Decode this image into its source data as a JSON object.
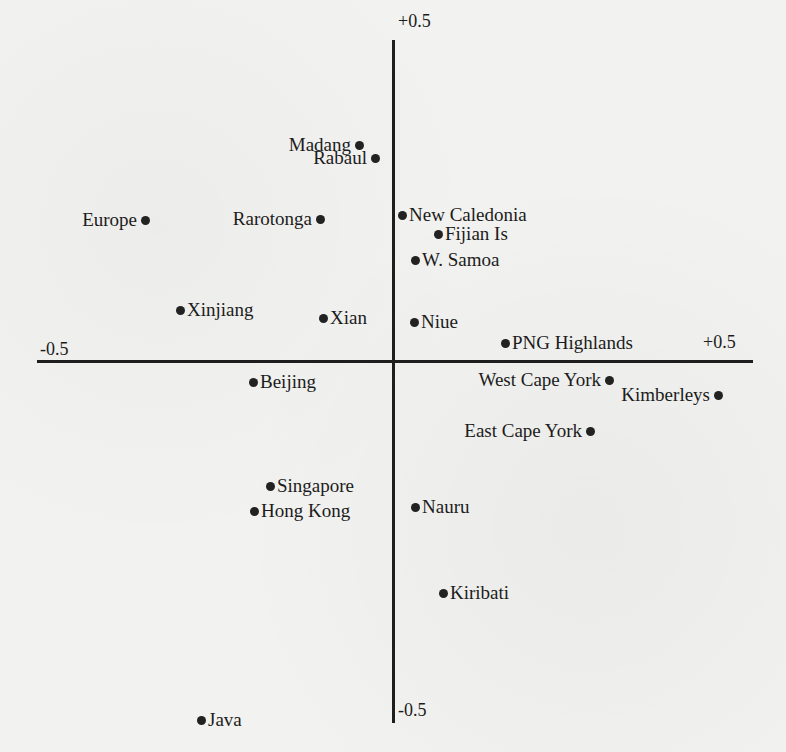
{
  "chart_data": {
    "type": "scatter",
    "title": "",
    "xlabel": "",
    "ylabel": "",
    "xlim": [
      -0.5,
      0.5
    ],
    "ylim": [
      -0.5,
      0.5
    ],
    "grid": false,
    "legend": null,
    "axis_labels": {
      "x_min": "-0.5",
      "x_max": "+0.5",
      "y_max": "+0.5",
      "y_min": "-0.5"
    },
    "points": [
      {
        "label": "Madang",
        "x": -0.05,
        "y": 0.33,
        "label_side": "left"
      },
      {
        "label": "Rabaul",
        "x": -0.03,
        "y": 0.31,
        "label_side": "left"
      },
      {
        "label": "Europe",
        "x": -0.35,
        "y": 0.21,
        "label_side": "left"
      },
      {
        "label": "Rarotonga",
        "x": -0.1,
        "y": 0.21,
        "label_side": "left"
      },
      {
        "label": "New Caledonia",
        "x": 0.01,
        "y": 0.22,
        "label_side": "right"
      },
      {
        "label": "Fijian Is",
        "x": 0.06,
        "y": 0.19,
        "label_side": "right"
      },
      {
        "label": "W. Samoa",
        "x": 0.03,
        "y": 0.15,
        "label_side": "right"
      },
      {
        "label": "Xinjiang",
        "x": -0.3,
        "y": 0.08,
        "label_side": "right"
      },
      {
        "label": "Xian",
        "x": -0.1,
        "y": 0.07,
        "label_side": "right"
      },
      {
        "label": "Niue",
        "x": 0.03,
        "y": 0.06,
        "label_side": "right"
      },
      {
        "label": "PNG Highlands",
        "x": 0.16,
        "y": 0.03,
        "label_side": "right"
      },
      {
        "label": "Beijing",
        "x": -0.2,
        "y": -0.03,
        "label_side": "right"
      },
      {
        "label": "West Cape York",
        "x": 0.3,
        "y": -0.03,
        "label_side": "left"
      },
      {
        "label": "Kimberleys",
        "x": 0.45,
        "y": -0.05,
        "label_side": "left"
      },
      {
        "label": "East Cape York",
        "x": 0.27,
        "y": -0.11,
        "label_side": "left"
      },
      {
        "label": "Singapore",
        "x": -0.17,
        "y": -0.19,
        "label_side": "right"
      },
      {
        "label": "Hong Kong",
        "x": -0.19,
        "y": -0.23,
        "label_side": "right"
      },
      {
        "label": "Nauru",
        "x": 0.03,
        "y": -0.22,
        "label_side": "right"
      },
      {
        "label": "Kiribati",
        "x": 0.07,
        "y": -0.35,
        "label_side": "right"
      },
      {
        "label": "Java",
        "x": -0.27,
        "y": -0.54,
        "label_side": "right"
      }
    ]
  },
  "plot": {
    "axis_labels": {
      "y_max": "+0.5",
      "y_min": "-0.5",
      "x_min": "-0.5",
      "x_max": "+0.5"
    },
    "points": [
      {
        "label": "Madang",
        "px": 359,
        "py": 145,
        "side": "left"
      },
      {
        "label": "Rabaul",
        "px": 375,
        "py": 158,
        "side": "left"
      },
      {
        "label": "Europe",
        "px": 145,
        "py": 220,
        "side": "left"
      },
      {
        "label": "Rarotonga",
        "px": 320,
        "py": 219,
        "side": "left"
      },
      {
        "label": "New Caledonia",
        "px": 402,
        "py": 215,
        "side": "right"
      },
      {
        "label": "Fijian Is",
        "px": 438,
        "py": 234,
        "side": "right"
      },
      {
        "label": "W. Samoa",
        "px": 415,
        "py": 260,
        "side": "right"
      },
      {
        "label": "Xinjiang",
        "px": 180,
        "py": 310,
        "side": "right"
      },
      {
        "label": "Xian",
        "px": 323,
        "py": 318,
        "side": "right"
      },
      {
        "label": "Niue",
        "px": 414,
        "py": 322,
        "side": "right"
      },
      {
        "label": "PNG Highlands",
        "px": 505,
        "py": 343,
        "side": "right"
      },
      {
        "label": "Beijing",
        "px": 253,
        "py": 382,
        "side": "right"
      },
      {
        "label": "West Cape York",
        "px": 609,
        "py": 380,
        "side": "left"
      },
      {
        "label": "Kimberleys",
        "px": 718,
        "py": 395,
        "side": "left"
      },
      {
        "label": "East Cape York",
        "px": 590,
        "py": 431,
        "side": "left"
      },
      {
        "label": "Singapore",
        "px": 270,
        "py": 486,
        "side": "right"
      },
      {
        "label": "Hong Kong",
        "px": 254,
        "py": 511,
        "side": "right"
      },
      {
        "label": "Nauru",
        "px": 415,
        "py": 507,
        "side": "right"
      },
      {
        "label": "Kiribati",
        "px": 443,
        "py": 593,
        "side": "right"
      },
      {
        "label": "Java",
        "px": 201,
        "py": 720,
        "side": "right"
      }
    ]
  }
}
